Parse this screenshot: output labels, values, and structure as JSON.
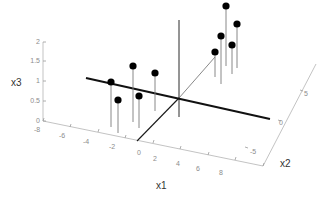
{
  "chart_data": {
    "type": "scatter",
    "subtype": "stem3",
    "title": "",
    "xlabel": "x1",
    "ylabel": "x2",
    "zlabel": "x3",
    "x_ticks": [
      "-8",
      "-6",
      "-4",
      "-2",
      "0",
      "2",
      "4",
      "6",
      "8"
    ],
    "y_ticks": [
      "-5",
      "0",
      "5"
    ],
    "z_ticks": [
      "0",
      "0.5",
      "1",
      "1.5",
      "2"
    ],
    "xlim": [
      -8,
      8
    ],
    "ylim": [
      -5,
      5
    ],
    "zlim": [
      0,
      2
    ],
    "grid": false,
    "legend": null,
    "series": [
      {
        "name": "cluster-1",
        "points": [
          {
            "x1": -3.5,
            "x2": 1.5,
            "x3": 1.0
          },
          {
            "x1": -2.5,
            "x2": -0.5,
            "x3": 0.7
          },
          {
            "x1": -2.0,
            "x2": 2.0,
            "x3": 1.2
          },
          {
            "x1": -1.5,
            "x2": 0.0,
            "x3": 0.7
          },
          {
            "x1": -0.5,
            "x2": 2.5,
            "x3": 0.8
          }
        ]
      },
      {
        "name": "cluster-2",
        "points": [
          {
            "x1": 1.0,
            "x2": 5.5,
            "x3": 1.3
          },
          {
            "x1": 2.0,
            "x2": 5.5,
            "x3": 0.9
          },
          {
            "x1": 2.5,
            "x2": 6.0,
            "x3": 1.8
          },
          {
            "x1": 3.0,
            "x2": 5.0,
            "x3": 0.6
          },
          {
            "x1": 3.5,
            "x2": 6.5,
            "x3": 1.0
          }
        ]
      }
    ],
    "reference_lines": [
      {
        "name": "decision-line",
        "style": "bold",
        "description": "line through origin in x1-x2 plane"
      },
      {
        "name": "x2-axis-line",
        "style": "thin"
      },
      {
        "name": "x3-axis-line",
        "style": "thin"
      }
    ]
  },
  "svg_geometry": {
    "stems": [
      {
        "cx": 111,
        "cy": 82,
        "base": 127
      },
      {
        "cx": 118,
        "cy": 100,
        "base": 133
      },
      {
        "cx": 133,
        "cy": 66,
        "base": 122
      },
      {
        "cx": 139,
        "cy": 96,
        "base": 128
      },
      {
        "cx": 155,
        "cy": 73,
        "base": 111
      },
      {
        "cx": 215,
        "cy": 52,
        "base": 77
      },
      {
        "cx": 221,
        "cy": 36,
        "base": 84
      },
      {
        "cx": 226,
        "cy": 6,
        "base": 66
      },
      {
        "cx": 232,
        "cy": 45,
        "base": 74
      },
      {
        "cx": 237,
        "cy": 24,
        "base": 68
      }
    ]
  }
}
